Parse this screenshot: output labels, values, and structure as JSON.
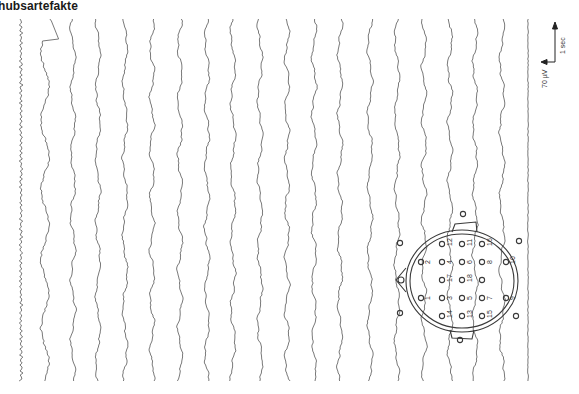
{
  "figure": {
    "title": "hubsartefakte",
    "scale_bar": {
      "amplitude_label": "70 µV",
      "time_label": "1 sec"
    },
    "channel_count": 20,
    "last_channel_type": "ECG",
    "head_diagram": {
      "electrode_numbers": [
        "1",
        "2",
        "3",
        "4",
        "5",
        "6",
        "7",
        "8",
        "9",
        "10",
        "11",
        "12",
        "13",
        "14",
        "15",
        "16",
        "17",
        "18"
      ]
    }
  }
}
